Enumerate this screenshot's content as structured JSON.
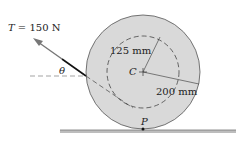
{
  "diagram": {
    "force_label": "T = 150 N",
    "force_symbol": "T",
    "force_value": "= 150 N",
    "angle_label": "θ",
    "inner_radius_label": "125 mm",
    "outer_radius_label": "200 mm",
    "center_label": "C",
    "contact_point_label": "P",
    "colors": {
      "wheel_fill": "#d9d9d9",
      "ground": "#999999",
      "line": "#222222"
    }
  }
}
